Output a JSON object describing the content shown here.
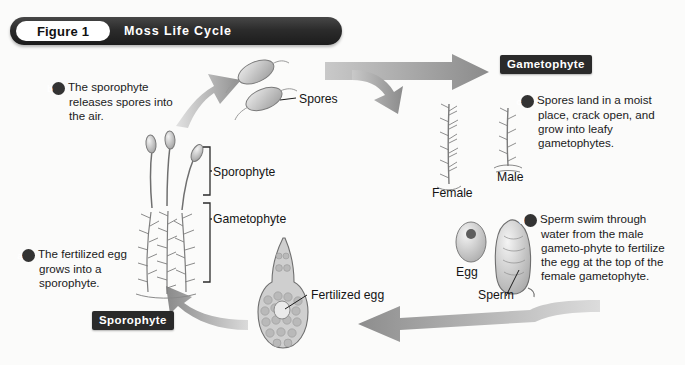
{
  "figure": {
    "number_label": "Figure 1",
    "title": "Moss Life Cycle"
  },
  "section_tags": {
    "gametophyte": "Gametophyte",
    "sporophyte": "Sporophyte"
  },
  "steps": [
    {
      "id": "a",
      "badge": "a",
      "text": "The fertilized egg grows into a sporophyte."
    },
    {
      "id": "b",
      "badge": "b",
      "text": "The sporophyte releases spores into the air."
    },
    {
      "id": "c",
      "badge": "c",
      "text": "Spores land in a moist place, crack open, and grow into leafy gametophytes."
    },
    {
      "id": "d",
      "badge": "d",
      "text": "Sperm swim through water from the male gameto-phyte to fertilize the egg at the top of the female gametophyte."
    }
  ],
  "labels": {
    "spores": "Spores",
    "bracket_sporophyte": "Sporophyte",
    "bracket_gametophyte": "Gametophyte",
    "female": "Female",
    "male": "Male",
    "egg": "Egg",
    "sperm": "Sperm",
    "fertilized_egg": "Fertilized egg"
  },
  "colors": {
    "title_bar": "#2c2c2c",
    "tag_background": "#2a2a2a",
    "arrow_gray": "#9a9a9a",
    "arrow_gray_light": "#d8d8d8",
    "text": "#1a1a1a",
    "page_background": "#fbfbfa"
  },
  "diagram": {
    "type": "cycle-diagram",
    "stages": [
      "Sporophyte",
      "Spores",
      "Gametophyte (female & male)",
      "Egg and Sperm",
      "Fertilized egg"
    ],
    "arrow_count": 4,
    "arrow_directions": [
      "up-right",
      "right-split",
      "down-left",
      "up-left"
    ]
  }
}
